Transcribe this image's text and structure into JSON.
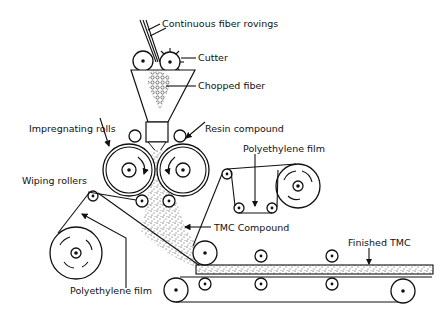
{
  "labels": {
    "continuous_fiber_rovings": "Continuous fiber rovings",
    "cutter": "Cutter",
    "chopped_fiber": "Chopped fiber",
    "impregnating_rolls": "Impregnating rolls",
    "resin_compound": "Resin compound",
    "polyethylene_film_top": "Polyethylene film",
    "wiping_rollers": "Wiping rollers",
    "tmc_compound": "TMC Compound",
    "finished_tmc": "Finished TMC",
    "polyethylene_film_bottom": "Polyethylene film"
  },
  "colors": {
    "line": "#111111",
    "background": "#ffffff"
  }
}
